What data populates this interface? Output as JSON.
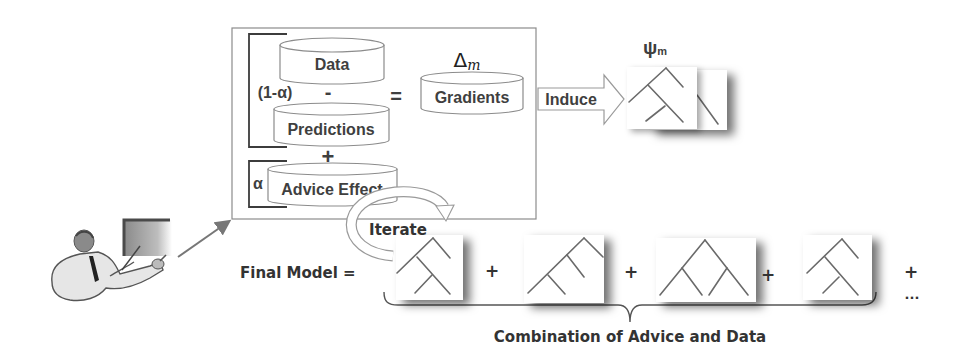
{
  "diagram": {
    "main_box": {
      "weight_data": "(1-α)",
      "weight_advice": "α",
      "minus": "-",
      "equals": "=",
      "plus": "+",
      "delta_symbol": "Δ",
      "delta_subscript": "m",
      "cylinders": {
        "data": "Data",
        "predictions": "Predictions",
        "advice_effect": "Advice Effect",
        "gradients": "Gradients"
      }
    },
    "induce_label": "Induce",
    "psi_symbol": "ψ",
    "psi_subscript": "m",
    "iterate_label": "Iterate",
    "final_model_label": "Final Model =",
    "sum_operators": [
      "+",
      "+",
      "+",
      "+"
    ],
    "ellipsis": "...",
    "brace_label": "Combination of Advice and Data",
    "colors": {
      "text": "#3f3f3f",
      "outline": "#8c8c8c",
      "tree_line": "#6a6a6a",
      "background": "#ffffff"
    }
  }
}
